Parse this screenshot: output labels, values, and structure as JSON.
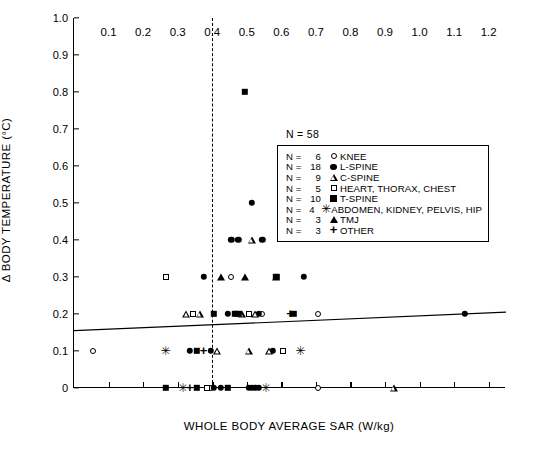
{
  "chart_data": {
    "type": "scatter",
    "title": "",
    "xlabel": "WHOLE BODY AVERAGE SAR (W/kg)",
    "ylabel": "Δ BODY TEMPERATURE (°C)",
    "xlim": [
      0.0,
      1.25
    ],
    "ylim": [
      0.0,
      1.0
    ],
    "xticks": [
      "0.1",
      "0.2",
      "0.3",
      "0.4",
      "0.5",
      "0.6",
      "0.7",
      "0.8",
      "0.9",
      "1.0",
      "1.1",
      "1.2"
    ],
    "xtick_values": [
      0.1,
      0.2,
      0.3,
      0.4,
      0.5,
      0.6,
      0.7,
      0.8,
      0.9,
      1.0,
      1.1,
      1.2
    ],
    "yticks": [
      "0",
      "0.1",
      "0.2",
      "0.3",
      "0.4",
      "0.5",
      "0.6",
      "0.7",
      "0.8",
      "0.9",
      "1.0"
    ],
    "ytick_values": [
      0,
      0.1,
      0.2,
      0.3,
      0.4,
      0.5,
      0.6,
      0.7,
      0.8,
      0.9,
      1.0
    ],
    "grid": false,
    "legend_position": "upper-right",
    "total_label": "N = 58",
    "total_n": 58,
    "annotations": [
      {
        "name": "sar-limit-line",
        "type": "vertical-dashed-line",
        "x": 0.4
      },
      {
        "name": "regression-line",
        "type": "line",
        "x1": 0.0,
        "y1": 0.155,
        "x2": 1.25,
        "y2": 0.205
      }
    ],
    "series": [
      {
        "name": "KNEE",
        "n": 6,
        "marker": "open-circle",
        "points": [
          [
            0.055,
            0.1
          ],
          [
            0.455,
            0.3
          ],
          [
            0.545,
            0.2
          ],
          [
            0.705,
            0.2
          ],
          [
            0.395,
            0.0
          ],
          [
            0.705,
            0.0
          ]
        ]
      },
      {
        "name": "L-SPINE",
        "n": 18,
        "marker": "filled-circle",
        "points": [
          [
            0.335,
            0.1
          ],
          [
            0.395,
            0.1
          ],
          [
            0.575,
            0.1
          ],
          [
            0.375,
            0.3
          ],
          [
            0.665,
            0.3
          ],
          [
            0.455,
            0.4
          ],
          [
            0.475,
            0.4
          ],
          [
            0.545,
            0.4
          ],
          [
            0.515,
            0.5
          ],
          [
            0.445,
            0.2
          ],
          [
            0.535,
            0.2
          ],
          [
            1.13,
            0.2
          ],
          [
            0.405,
            0.0
          ],
          [
            0.425,
            0.0
          ],
          [
            0.505,
            0.0
          ],
          [
            0.515,
            0.0
          ],
          [
            0.525,
            0.0
          ],
          [
            0.535,
            0.0
          ]
        ]
      },
      {
        "name": "C-SPINE",
        "n": 9,
        "marker": "open-triangle",
        "points": [
          [
            0.415,
            0.1
          ],
          [
            0.505,
            0.1
          ],
          [
            0.565,
            0.1
          ],
          [
            0.515,
            0.4
          ],
          [
            0.325,
            0.2
          ],
          [
            0.365,
            0.2
          ],
          [
            0.485,
            0.2
          ],
          [
            0.525,
            0.2
          ],
          [
            0.925,
            0.0
          ]
        ]
      },
      {
        "name": "HEART, THORAX, CHEST",
        "n": 5,
        "marker": "open-square",
        "points": [
          [
            0.605,
            0.1
          ],
          [
            0.265,
            0.3
          ],
          [
            0.345,
            0.2
          ],
          [
            0.505,
            0.2
          ],
          [
            0.385,
            0.0
          ]
        ]
      },
      {
        "name": "T-SPINE",
        "n": 10,
        "marker": "filled-square",
        "points": [
          [
            0.355,
            0.1
          ],
          [
            0.585,
            0.3
          ],
          [
            0.495,
            0.8
          ],
          [
            0.405,
            0.2
          ],
          [
            0.465,
            0.2
          ],
          [
            0.475,
            0.2
          ],
          [
            0.635,
            0.2
          ],
          [
            0.265,
            0.0
          ],
          [
            0.355,
            0.0
          ],
          [
            0.445,
            0.0
          ]
        ]
      },
      {
        "name": "ABDOMEN, KIDNEY, PELVIS, HIP",
        "n": 4,
        "marker": "asterisk",
        "points": [
          [
            0.265,
            0.1
          ],
          [
            0.655,
            0.1
          ],
          [
            0.315,
            0.0
          ],
          [
            0.555,
            0.0
          ]
        ]
      },
      {
        "name": "TMJ",
        "n": 3,
        "marker": "filled-triangle",
        "points": [
          [
            0.425,
            0.3
          ],
          [
            0.495,
            0.3
          ],
          [
            0.585,
            0.3
          ]
        ]
      },
      {
        "name": "OTHER",
        "n": 3,
        "marker": "plus",
        "points": [
          [
            0.375,
            0.1
          ],
          [
            0.625,
            0.2
          ],
          [
            0.335,
            0.0
          ]
        ]
      }
    ]
  },
  "legend": {
    "title": "N = 58",
    "rows": [
      {
        "n_label": "N =",
        "n": "6",
        "marker": "open-circle",
        "label": "KNEE"
      },
      {
        "n_label": "N =",
        "n": "18",
        "marker": "filled-circle",
        "label": "L-SPINE"
      },
      {
        "n_label": "N =",
        "n": "9",
        "marker": "open-triangle",
        "label": "C-SPINE"
      },
      {
        "n_label": "N =",
        "n": "5",
        "marker": "open-square",
        "label": "HEART, THORAX, CHEST"
      },
      {
        "n_label": "N =",
        "n": "10",
        "marker": "filled-square",
        "label": "T-SPINE"
      },
      {
        "n_label": "N =",
        "n": "4",
        "marker": "asterisk",
        "label": "ABDOMEN, KIDNEY, PELVIS, HIP"
      },
      {
        "n_label": "N =",
        "n": "3",
        "marker": "filled-triangle",
        "label": "TMJ"
      },
      {
        "n_label": "N =",
        "n": "3",
        "marker": "plus",
        "label": "OTHER"
      }
    ]
  },
  "markers": {
    "open-circle": "○",
    "filled-circle": "●",
    "open-triangle": "△",
    "filled-triangle": "▲",
    "open-square": "□",
    "filled-square": "■",
    "asterisk": "✳",
    "plus": "+"
  },
  "colors": {
    "axis": "#000000",
    "marker": "#000000",
    "background": "#ffffff"
  }
}
